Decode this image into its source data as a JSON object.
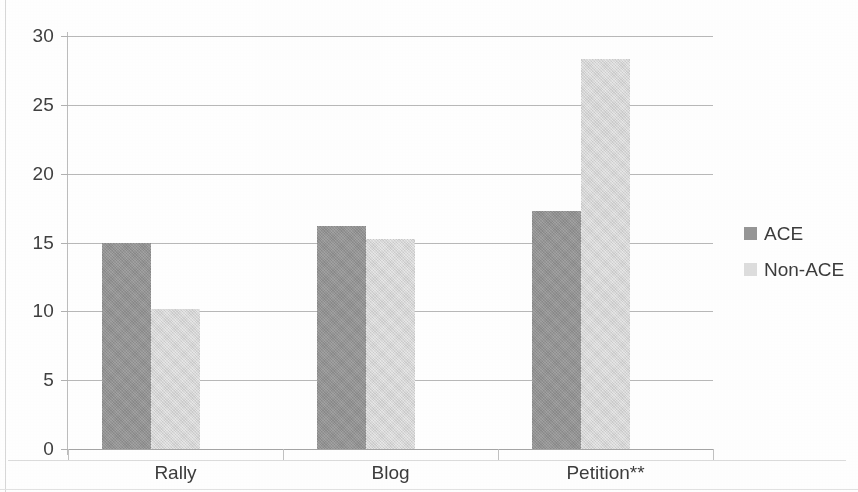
{
  "chart_data": {
    "type": "bar",
    "title": "",
    "subtitle": "",
    "xlabel": "",
    "ylabel": "",
    "categories": [
      "Rally",
      "Blog",
      "Petition**"
    ],
    "series": [
      {
        "name": "ACE",
        "color": "#969696",
        "values": [
          15.0,
          16.2,
          17.3
        ]
      },
      {
        "name": "Non-ACE",
        "color": "#dedede",
        "values": [
          10.2,
          15.25,
          28.3
        ]
      }
    ],
    "ylim": [
      0,
      30
    ],
    "ytick_labels": [
      "0",
      "5",
      "10",
      "15",
      "20",
      "25",
      "30"
    ],
    "ytick_values": [
      0,
      5,
      10,
      15,
      20,
      25,
      30
    ],
    "grid": "horizontal",
    "legend_position": "right",
    "annotations": [
      "**"
    ]
  },
  "legend": {
    "items": [
      {
        "label": "ACE",
        "swatch": "dark-gray-square"
      },
      {
        "label": "Non-ACE",
        "swatch": "light-gray-square"
      }
    ]
  },
  "axes": {
    "y": {
      "labels": [
        "30",
        "25",
        "20",
        "15",
        "10",
        "5",
        "0"
      ]
    },
    "x": {
      "labels": [
        "Rally",
        "Blog",
        "Petition**"
      ]
    }
  }
}
